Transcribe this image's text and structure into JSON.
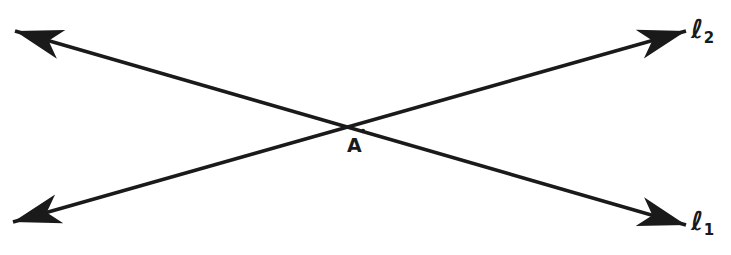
{
  "figure": {
    "kind": "geometry-diagram",
    "width": 731,
    "height": 255,
    "background_color": "#ffffff",
    "stroke_color": "#1a1a1a",
    "stroke_width": 3.6
  },
  "points": [
    {
      "id": "A",
      "label": "A",
      "x": 363,
      "y": 131,
      "label_x": 356,
      "label_y": 147,
      "description": "intersection point of line 1 and line 2"
    }
  ],
  "lines": [
    {
      "id": "l1",
      "label_ell": "ℓ",
      "label_subscript": "1",
      "label_text": "ℓ1",
      "from_x": 15,
      "from_y": 31,
      "to_x": 686,
      "to_y": 225,
      "arrow_start": true,
      "arrow_end": true,
      "label_x": 700,
      "label_y": 222,
      "description": "line through A descending from upper-left to lower-right, double-headed"
    },
    {
      "id": "l2",
      "label_ell": "ℓ",
      "label_subscript": "2",
      "label_text": "ℓ2",
      "from_x": 13,
      "from_y": 222,
      "to_x": 686,
      "to_y": 31,
      "arrow_start": true,
      "arrow_end": true,
      "label_x": 700,
      "label_y": 30,
      "description": "line through A ascending from lower-left to upper-right, double-headed"
    }
  ],
  "arrowheads": [
    {
      "id": "l1-start",
      "name": "arrowhead-upper-left",
      "tip_x": 15,
      "tip_y": 31
    },
    {
      "id": "l1-end",
      "name": "arrowhead-lower-right",
      "tip_x": 686,
      "tip_y": 225
    },
    {
      "id": "l2-start",
      "name": "arrowhead-lower-left",
      "tip_x": 13,
      "tip_y": 222
    },
    {
      "id": "l2-end",
      "name": "arrowhead-upper-right",
      "tip_x": 686,
      "tip_y": 31
    }
  ]
}
